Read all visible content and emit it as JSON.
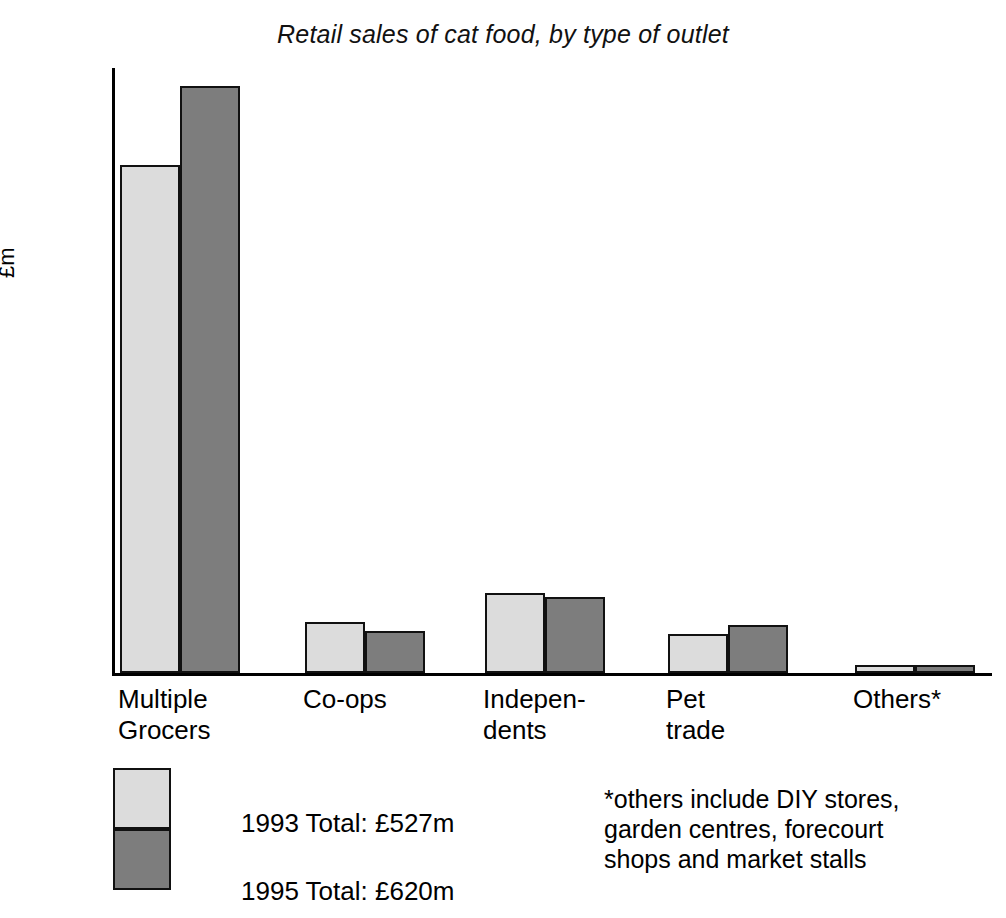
{
  "chart_data": {
    "type": "bar",
    "title": "Retail sales of cat food, by type of outlet",
    "xlabel": "",
    "ylabel": "£m",
    "ylim": [
      0,
      500
    ],
    "yticks": [
      "0",
      "100",
      "200",
      "300",
      "400",
      "500"
    ],
    "grid": false,
    "legend_position": "bottom-left",
    "categories": [
      "Multiple\nGrocers",
      "Co-ops",
      "Indepen-\ndents",
      "Pet\ntrade",
      "Others*"
    ],
    "series": [
      {
        "name": "1993 Total: £527m",
        "color": "#dcdcdc",
        "values": [
          420,
          42,
          66,
          32,
          7
        ]
      },
      {
        "name": "1995 Total: £620m",
        "color": "#7d7d7d",
        "values": [
          485,
          35,
          63,
          40,
          7
        ]
      }
    ],
    "annotations": [
      "*others include DIY stores,\ngarden centres, forecourt\nshops and market stalls"
    ]
  },
  "legend": {
    "item1_label": "1993 Total: £527m",
    "item2_label": "1995 Total: £620m"
  },
  "footnote": {
    "text": "*others include DIY stores,\ngarden centres, forecourt\nshops and market stalls"
  },
  "colors": {
    "series_1993": "#dcdcdc",
    "series_1995": "#7d7d7d",
    "axis": "#000000",
    "background": "#ffffff"
  }
}
